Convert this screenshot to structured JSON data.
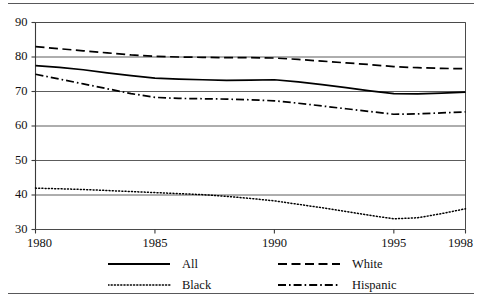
{
  "figure": {
    "name": "line-chart-figure",
    "top_rule": true,
    "bottom_rule": true
  },
  "chart_data": {
    "type": "line",
    "title": "",
    "subtitle": "",
    "xlabel": "",
    "ylabel": "",
    "x": [
      1980,
      1981,
      1982,
      1983,
      1984,
      1985,
      1986,
      1987,
      1988,
      1989,
      1990,
      1991,
      1992,
      1993,
      1994,
      1995,
      1996,
      1997,
      1998
    ],
    "xlim": [
      1980,
      1998
    ],
    "ylim": [
      30,
      90
    ],
    "xticks": [
      1980,
      1985,
      1990,
      1995,
      1998
    ],
    "xtick_labels": [
      "1980",
      "1985",
      "1990",
      "1995",
      "1998"
    ],
    "yticks": [
      30,
      40,
      50,
      60,
      70,
      80,
      90
    ],
    "ytick_labels": [
      "30",
      "40",
      "50",
      "60",
      "70",
      "80",
      "90"
    ],
    "grid": "horizontal",
    "legend_position": "bottom",
    "series": [
      {
        "name": "All",
        "style": "solid",
        "color": "#000000",
        "values": [
          77.5,
          77.0,
          76.3,
          75.4,
          74.6,
          73.9,
          73.6,
          73.4,
          73.2,
          73.3,
          73.4,
          72.8,
          72.0,
          71.1,
          70.2,
          69.4,
          69.3,
          69.5,
          69.8
        ]
      },
      {
        "name": "White",
        "style": "dashed",
        "color": "#000000",
        "values": [
          83.0,
          82.4,
          81.8,
          81.2,
          80.6,
          80.2,
          80.0,
          79.9,
          79.8,
          79.8,
          79.7,
          79.3,
          78.8,
          78.3,
          77.8,
          77.2,
          76.9,
          76.7,
          76.6
        ]
      },
      {
        "name": "Black",
        "style": "dotted",
        "color": "#000000",
        "values": [
          42.0,
          41.8,
          41.6,
          41.3,
          41.0,
          40.7,
          40.4,
          40.1,
          39.6,
          39.0,
          38.3,
          37.3,
          36.3,
          35.2,
          34.1,
          33.1,
          33.4,
          34.6,
          36.0
        ]
      },
      {
        "name": "Hispanic",
        "style": "dashdot",
        "color": "#000000",
        "values": [
          75.0,
          73.6,
          72.2,
          70.8,
          69.4,
          68.3,
          68.0,
          67.9,
          67.8,
          67.6,
          67.3,
          66.6,
          65.8,
          65.0,
          64.2,
          63.4,
          63.5,
          63.8,
          64.1
        ]
      }
    ]
  },
  "legend": {
    "items": [
      {
        "label": "All",
        "style": "solid",
        "key": "legend-item-all"
      },
      {
        "label": "Black",
        "style": "dotted",
        "key": "legend-item-black"
      },
      {
        "label": "White",
        "style": "dashed",
        "key": "legend-item-white"
      },
      {
        "label": "Hispanic",
        "style": "dashdot",
        "key": "legend-item-hispanic"
      }
    ]
  }
}
